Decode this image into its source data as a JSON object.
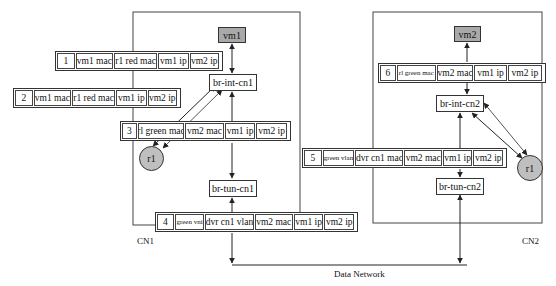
{
  "hosts": [
    {
      "id": "cn1",
      "label": "CN1"
    },
    {
      "id": "cn2",
      "label": "CN2"
    }
  ],
  "nodes": {
    "vm1": "vm1",
    "vm2": "vm2",
    "br_int_cn1": "br-int-cn1",
    "br_tun_cn1": "br-tun-cn1",
    "br_int_cn2": "br-int-cn2",
    "br_tun_cn2": "br-tun-cn2",
    "r1_cn1": "r1",
    "r1_cn2": "r1"
  },
  "network_label": "Data Network",
  "packets": [
    {
      "step": "1",
      "fields": [
        "vm1 mac",
        "r1 red mac",
        "vm1 ip",
        "vm2 ip"
      ]
    },
    {
      "step": "2",
      "fields": [
        "vm1 mac",
        "r1 red mac",
        "vm1 ip",
        "vm2 ip"
      ]
    },
    {
      "step": "3",
      "fields": [
        "rl green mac",
        "vm2 mac",
        "vm1 ip",
        "vm2 ip"
      ]
    },
    {
      "step": "4",
      "fields": [
        "green vni",
        "dvr cn1 vlan",
        "vm2 mac",
        "vm1 ip",
        "vm2 ip"
      ]
    },
    {
      "step": "5",
      "fields": [
        "green vlan",
        "dvr cn1 mac",
        "vm2 mac",
        "vm1 ip",
        "vm2 ip"
      ]
    },
    {
      "step": "6",
      "fields": [
        "rl green mac",
        "vm2 mac",
        "vm1 ip",
        "vm2 ip"
      ]
    }
  ],
  "colors": {
    "vm_fill": "#a9a9a9",
    "router_fill": "#bfbfbf",
    "line": "#333333"
  }
}
